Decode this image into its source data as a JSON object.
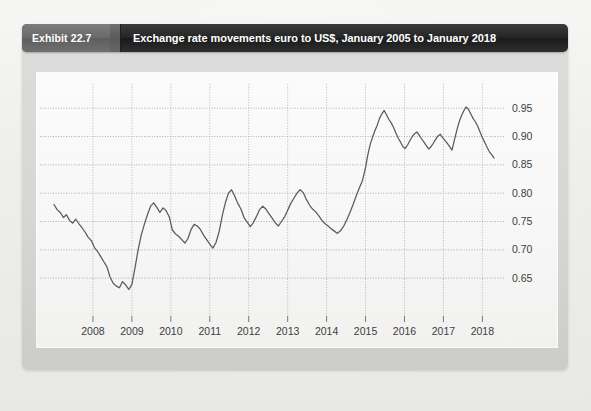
{
  "header": {
    "badge_label": "Exhibit 22.7",
    "title": "Exchange rate movements euro to US$, January 2005 to January 2018"
  },
  "colors": {
    "header_bar": "#262626",
    "header_badge": "#6a6a6a",
    "card": "#d6d6d4",
    "plot_background": "#f7f7f7",
    "line": "#5a5a5a",
    "gridline": "#9a9a9a",
    "tick_text": "#3d3d3d"
  },
  "chart_data": {
    "type": "line",
    "title": "Exchange rate movements euro to US$, January 2005 to January 2018",
    "xlabel": "",
    "ylabel": "",
    "grid": true,
    "legend": null,
    "xlim": [
      2007.0,
      2018.35
    ],
    "ylim": [
      0.615,
      0.975
    ],
    "ytick_labels": [
      "0.95",
      "0.90",
      "0.85",
      "0.80",
      "0.75",
      "0.70",
      "0.65"
    ],
    "yticks": [
      0.95,
      0.9,
      0.85,
      0.8,
      0.75,
      0.7,
      0.65
    ],
    "xtick_labels": [
      "2008",
      "2009",
      "2010",
      "2011",
      "2012",
      "2013",
      "2014",
      "2015",
      "2016",
      "2017",
      "2018"
    ],
    "xticks": [
      2008,
      2009,
      2010,
      2011,
      2012,
      2013,
      2014,
      2015,
      2016,
      2017,
      2018
    ],
    "series": [
      {
        "name": "EUR per US$",
        "x": [
          2007.0,
          2007.08,
          2007.16,
          2007.24,
          2007.32,
          2007.4,
          2007.48,
          2007.56,
          2007.64,
          2007.72,
          2007.8,
          2007.88,
          2007.96,
          2008.04,
          2008.12,
          2008.2,
          2008.28,
          2008.36,
          2008.44,
          2008.52,
          2008.6,
          2008.68,
          2008.76,
          2008.84,
          2008.92,
          2009.0,
          2009.08,
          2009.16,
          2009.24,
          2009.32,
          2009.4,
          2009.48,
          2009.56,
          2009.64,
          2009.72,
          2009.8,
          2009.88,
          2009.96,
          2010.04,
          2010.12,
          2010.2,
          2010.28,
          2010.36,
          2010.44,
          2010.52,
          2010.6,
          2010.68,
          2010.76,
          2010.84,
          2010.92,
          2011.0,
          2011.08,
          2011.16,
          2011.24,
          2011.32,
          2011.4,
          2011.48,
          2011.56,
          2011.64,
          2011.72,
          2011.8,
          2011.88,
          2011.96,
          2012.04,
          2012.12,
          2012.2,
          2012.28,
          2012.36,
          2012.44,
          2012.52,
          2012.6,
          2012.68,
          2012.76,
          2012.84,
          2012.92,
          2013.0,
          2013.08,
          2013.16,
          2013.24,
          2013.32,
          2013.4,
          2013.48,
          2013.56,
          2013.64,
          2013.72,
          2013.8,
          2013.88,
          2013.96,
          2014.04,
          2014.12,
          2014.2,
          2014.28,
          2014.36,
          2014.44,
          2014.52,
          2014.6,
          2014.68,
          2014.76,
          2014.84,
          2014.92,
          2015.0,
          2015.06,
          2015.12,
          2015.18,
          2015.24,
          2015.3,
          2015.36,
          2015.42,
          2015.48,
          2015.54,
          2015.6,
          2015.66,
          2015.72,
          2015.78,
          2015.84,
          2015.9,
          2015.96,
          2016.02,
          2016.08,
          2016.14,
          2016.2,
          2016.26,
          2016.32,
          2016.38,
          2016.44,
          2016.5,
          2016.56,
          2016.62,
          2016.68,
          2016.74,
          2016.8,
          2016.86,
          2016.92,
          2016.98,
          2017.04,
          2017.1,
          2017.16,
          2017.22,
          2017.28,
          2017.34,
          2017.4,
          2017.46,
          2017.52,
          2017.58,
          2017.64,
          2017.7,
          2017.76,
          2017.82,
          2017.88,
          2017.94,
          2018.0,
          2018.06,
          2018.12,
          2018.18,
          2018.24,
          2018.3
        ],
        "y": [
          0.78,
          0.771,
          0.766,
          0.757,
          0.762,
          0.752,
          0.747,
          0.754,
          0.746,
          0.739,
          0.731,
          0.722,
          0.716,
          0.704,
          0.697,
          0.688,
          0.679,
          0.67,
          0.652,
          0.641,
          0.636,
          0.633,
          0.644,
          0.638,
          0.63,
          0.639,
          0.668,
          0.7,
          0.726,
          0.745,
          0.762,
          0.777,
          0.783,
          0.775,
          0.766,
          0.774,
          0.769,
          0.758,
          0.735,
          0.728,
          0.724,
          0.718,
          0.712,
          0.72,
          0.736,
          0.745,
          0.742,
          0.736,
          0.726,
          0.718,
          0.71,
          0.703,
          0.713,
          0.732,
          0.76,
          0.783,
          0.8,
          0.806,
          0.795,
          0.782,
          0.772,
          0.757,
          0.749,
          0.741,
          0.748,
          0.759,
          0.771,
          0.777,
          0.772,
          0.764,
          0.756,
          0.748,
          0.742,
          0.75,
          0.758,
          0.77,
          0.782,
          0.791,
          0.8,
          0.806,
          0.801,
          0.789,
          0.779,
          0.772,
          0.767,
          0.76,
          0.752,
          0.746,
          0.742,
          0.737,
          0.733,
          0.729,
          0.734,
          0.742,
          0.753,
          0.766,
          0.78,
          0.795,
          0.809,
          0.822,
          0.845,
          0.868,
          0.886,
          0.899,
          0.91,
          0.92,
          0.932,
          0.94,
          0.946,
          0.938,
          0.93,
          0.924,
          0.916,
          0.906,
          0.897,
          0.89,
          0.882,
          0.879,
          0.885,
          0.893,
          0.9,
          0.905,
          0.908,
          0.902,
          0.896,
          0.89,
          0.884,
          0.878,
          0.882,
          0.888,
          0.895,
          0.901,
          0.904,
          0.898,
          0.893,
          0.888,
          0.882,
          0.876,
          0.893,
          0.91,
          0.925,
          0.936,
          0.945,
          0.952,
          0.948,
          0.94,
          0.932,
          0.926,
          0.918,
          0.908,
          0.898,
          0.89,
          0.881,
          0.873,
          0.868,
          0.862
        ]
      }
    ]
  }
}
